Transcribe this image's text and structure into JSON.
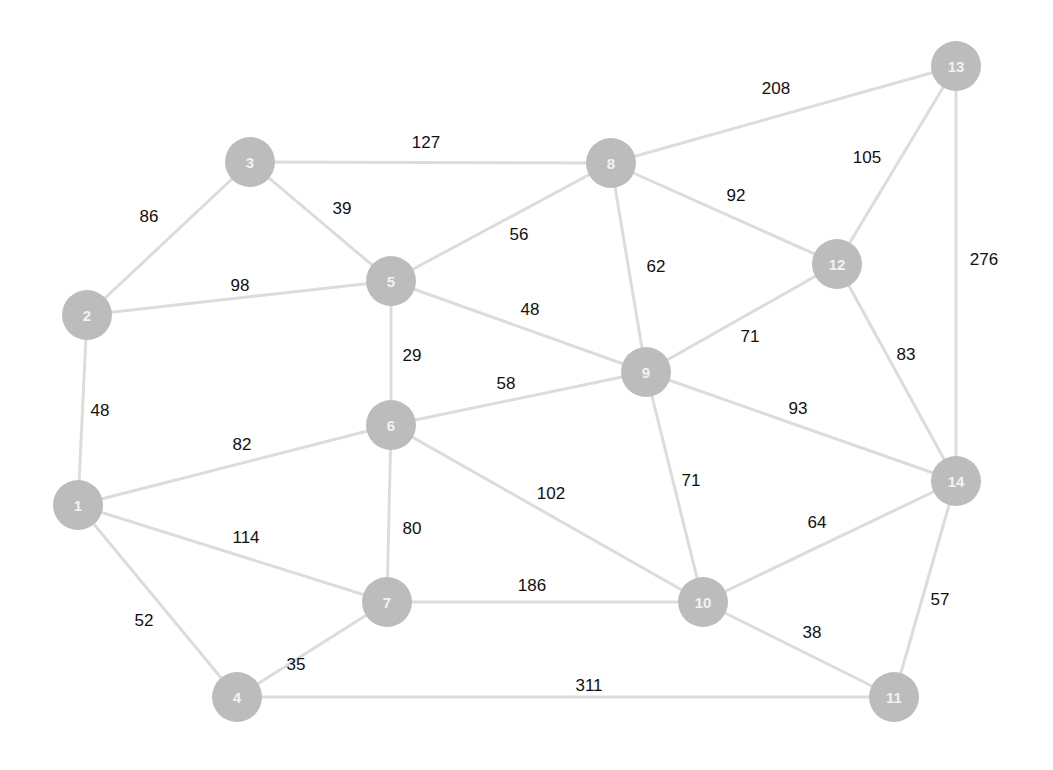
{
  "diagram": {
    "type": "weighted-undirected-graph",
    "nodes": [
      {
        "id": "1",
        "x": 78,
        "y": 505
      },
      {
        "id": "2",
        "x": 87,
        "y": 315
      },
      {
        "id": "3",
        "x": 250,
        "y": 162
      },
      {
        "id": "4",
        "x": 237,
        "y": 697
      },
      {
        "id": "5",
        "x": 391,
        "y": 281
      },
      {
        "id": "6",
        "x": 391,
        "y": 425
      },
      {
        "id": "7",
        "x": 387,
        "y": 602
      },
      {
        "id": "8",
        "x": 611,
        "y": 163
      },
      {
        "id": "9",
        "x": 646,
        "y": 372
      },
      {
        "id": "10",
        "x": 703,
        "y": 602
      },
      {
        "id": "11",
        "x": 894,
        "y": 697
      },
      {
        "id": "12",
        "x": 837,
        "y": 264
      },
      {
        "id": "13",
        "x": 956,
        "y": 66
      },
      {
        "id": "14",
        "x": 956,
        "y": 481
      }
    ],
    "edges": [
      {
        "from": "1",
        "to": "2",
        "weight": "48",
        "lx": 100,
        "ly": 410
      },
      {
        "from": "1",
        "to": "6",
        "weight": "82",
        "lx": 242,
        "ly": 444
      },
      {
        "from": "1",
        "to": "7",
        "weight": "114",
        "lx": 246,
        "ly": 537
      },
      {
        "from": "1",
        "to": "4",
        "weight": "52",
        "lx": 144,
        "ly": 620
      },
      {
        "from": "2",
        "to": "3",
        "weight": "86",
        "lx": 149,
        "ly": 216
      },
      {
        "from": "2",
        "to": "5",
        "weight": "98",
        "lx": 240,
        "ly": 285
      },
      {
        "from": "3",
        "to": "5",
        "weight": "39",
        "lx": 342,
        "ly": 208
      },
      {
        "from": "3",
        "to": "8",
        "weight": "127",
        "lx": 426,
        "ly": 142
      },
      {
        "from": "5",
        "to": "8",
        "weight": "56",
        "lx": 519,
        "ly": 234
      },
      {
        "from": "5",
        "to": "9",
        "weight": "48",
        "lx": 530,
        "ly": 309
      },
      {
        "from": "5",
        "to": "6",
        "weight": "29",
        "lx": 412,
        "ly": 355
      },
      {
        "from": "6",
        "to": "9",
        "weight": "58",
        "lx": 506,
        "ly": 383
      },
      {
        "from": "6",
        "to": "7",
        "weight": "80",
        "lx": 412,
        "ly": 528
      },
      {
        "from": "6",
        "to": "10",
        "weight": "102",
        "lx": 551,
        "ly": 493
      },
      {
        "from": "7",
        "to": "4",
        "weight": "35",
        "lx": 296,
        "ly": 664
      },
      {
        "from": "7",
        "to": "10",
        "weight": "186",
        "lx": 532,
        "ly": 585
      },
      {
        "from": "4",
        "to": "11",
        "weight": "311",
        "lx": 589,
        "ly": 685
      },
      {
        "from": "8",
        "to": "13",
        "weight": "208",
        "lx": 776,
        "ly": 88
      },
      {
        "from": "8",
        "to": "12",
        "weight": "92",
        "lx": 736,
        "ly": 195
      },
      {
        "from": "8",
        "to": "9",
        "weight": "62",
        "lx": 656,
        "ly": 266
      },
      {
        "from": "9",
        "to": "12",
        "weight": "71",
        "lx": 750,
        "ly": 336
      },
      {
        "from": "9",
        "to": "14",
        "weight": "93",
        "lx": 798,
        "ly": 408
      },
      {
        "from": "9",
        "to": "10",
        "weight": "71",
        "lx": 691,
        "ly": 480
      },
      {
        "from": "12",
        "to": "13",
        "weight": "105",
        "lx": 867,
        "ly": 157
      },
      {
        "from": "12",
        "to": "14",
        "weight": "83",
        "lx": 906,
        "ly": 354
      },
      {
        "from": "13",
        "to": "14",
        "weight": "276",
        "lx": 984,
        "ly": 259
      },
      {
        "from": "14",
        "to": "10",
        "weight": "64",
        "lx": 817,
        "ly": 522
      },
      {
        "from": "14",
        "to": "11",
        "weight": "57",
        "lx": 940,
        "ly": 599
      },
      {
        "from": "10",
        "to": "11",
        "weight": "38",
        "lx": 812,
        "ly": 632
      }
    ],
    "node_radius": 25,
    "colors": {
      "node": "#bcbcbc",
      "node_label": "#f2f2f2",
      "edge": "#dcdcdc",
      "edge_label": "#111111"
    }
  }
}
